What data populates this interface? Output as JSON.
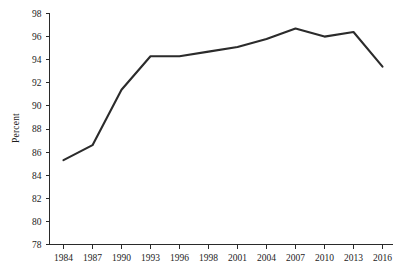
{
  "chart_data": {
    "type": "line",
    "title": "",
    "subtitle": "",
    "xlabel": "",
    "ylabel": "Percent",
    "x": [
      1984,
      1987,
      1990,
      1993,
      1996,
      1998,
      2001,
      2004,
      2007,
      2010,
      2013,
      2016
    ],
    "categories": [
      "1984",
      "1987",
      "1990",
      "1993",
      "1996",
      "1998",
      "2001",
      "2004",
      "2007",
      "2010",
      "2013",
      "2016"
    ],
    "values": [
      85.3,
      86.6,
      91.4,
      94.3,
      94.3,
      94.7,
      95.1,
      95.8,
      96.7,
      96.0,
      96.4,
      93.4
    ],
    "series": [
      {
        "name": "Percent",
        "values": [
          85.3,
          86.6,
          91.4,
          94.3,
          94.3,
          94.7,
          95.1,
          95.8,
          96.7,
          96.0,
          96.4,
          93.4
        ],
        "color": "#2b2b2b"
      }
    ],
    "ylim": [
      78,
      98
    ],
    "yticks": [
      78,
      80,
      82,
      84,
      86,
      88,
      90,
      92,
      94,
      96,
      98
    ],
    "ytick_labels": [
      "78",
      "80",
      "82",
      "84",
      "86",
      "88",
      "90",
      "92",
      "94",
      "96",
      "98"
    ],
    "xtick_labels": [
      "1984",
      "1987",
      "1990",
      "1993",
      "1996",
      "1998",
      "2001",
      "2004",
      "2007",
      "2010",
      "2013",
      "2016"
    ],
    "grid": false,
    "legend": false,
    "legend_position": "none",
    "annotations": []
  },
  "axes": {
    "y_axis_title": "Percent"
  },
  "colors": {
    "line": "#2b2b2b",
    "axis": "#2a2a2a",
    "text": "#1c1c1c",
    "background": "#ffffff"
  }
}
